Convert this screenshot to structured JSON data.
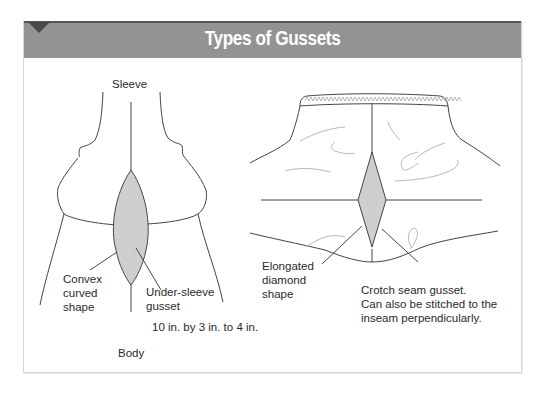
{
  "header": {
    "title": "Types of Gussets"
  },
  "colors": {
    "header_band": "#939393",
    "header_rule": "#555555",
    "gusset_fill": "#cfcfcf",
    "line": "#444444",
    "fold_line": "#b5b5b5",
    "border": "#d6d6d6"
  },
  "left_diagram": {
    "top_label": "Sleeve",
    "bottom_label": "Body",
    "callout_left": "Convex\ncurved\nshape",
    "callout_right": "Under-sleeve\ngusset",
    "dimension_note": "10 in. by 3 in. to 4 in."
  },
  "right_diagram": {
    "callout_left": "Elongated\ndiamond\nshape",
    "callout_right": "Crotch seam gusset.\nCan also be stitched to the\ninseam perpendicularly."
  }
}
